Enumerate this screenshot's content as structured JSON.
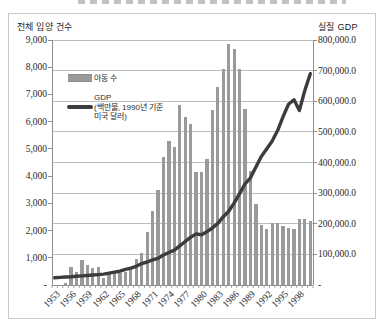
{
  "legend": {
    "bars_label": "아동 수",
    "gdp_line1": "GDP",
    "gdp_line2": "(백만불, 1990년 기준",
    "gdp_line3": "미국 달러)"
  },
  "chart_data": {
    "type": "combo-bar-line",
    "x": [
      1953,
      1954,
      1955,
      1956,
      1957,
      1958,
      1959,
      1960,
      1961,
      1962,
      1963,
      1964,
      1965,
      1966,
      1967,
      1968,
      1969,
      1970,
      1971,
      1972,
      1973,
      1974,
      1975,
      1976,
      1977,
      1978,
      1979,
      1980,
      1981,
      1982,
      1983,
      1984,
      1985,
      1986,
      1987,
      1988,
      1989,
      1990,
      1991,
      1992,
      1993,
      1994,
      1995,
      1996,
      1997,
      1998,
      1999,
      2000
    ],
    "x_tick_labels": [
      "1953",
      "1956",
      "1959",
      "1962",
      "1965",
      "1968",
      "1971",
      "1974",
      "1977",
      "1980",
      "1983",
      "1986",
      "1989",
      "1992",
      "1995",
      "1998"
    ],
    "x_tick_step": 3,
    "series": [
      {
        "name": "아동 수",
        "type": "bar",
        "axis": "left",
        "color": "#9a9a9a",
        "values": [
          4,
          8,
          59,
          671,
          486,
          930,
          741,
          638,
          660,
          254,
          442,
          462,
          451,
          494,
          626,
          949,
          1190,
          1932,
          2725,
          3490,
          4688,
          5302,
          5077,
          6597,
          6159,
          5917,
          4148,
          4144,
          4628,
          6434,
          7263,
          7924,
          8837,
          8680,
          7947,
          6463,
          4191,
          2962,
          2197,
          2045,
          2290,
          2262,
          2180,
          2080,
          2057,
          2443,
          2409,
          2360
        ]
      },
      {
        "name": "GDP (백만불, 1990년 기준 미국 달러)",
        "type": "line",
        "axis": "right",
        "color": "#3c3c3c",
        "values": [
          23600,
          24900,
          26200,
          26800,
          28300,
          29800,
          31000,
          32500,
          34000,
          35500,
          39000,
          42000,
          45000,
          51000,
          55000,
          61000,
          70000,
          75000,
          82000,
          87000,
          98000,
          106000,
          114000,
          128000,
          142000,
          156000,
          167000,
          164000,
          174000,
          186000,
          201000,
          223000,
          241000,
          268000,
          298000,
          330000,
          350000,
          385000,
          420000,
          445000,
          470000,
          505000,
          550000,
          590000,
          605000,
          570000,
          635000,
          690000
        ]
      }
    ],
    "left_axis": {
      "title": "전체 입양 건수",
      "min": 0,
      "max": 9000,
      "step": 1000,
      "tick_labels": [
        "9,000",
        "8,000",
        "7,000",
        "6,000",
        "5,000",
        "4,000",
        "3,000",
        "2,000",
        "1,000",
        "-"
      ]
    },
    "right_axis": {
      "title": "실질 GDP",
      "min": 0,
      "max": 800000,
      "step": 100000,
      "tick_labels": [
        "800,000.0",
        "700,000.0",
        "600,000.0",
        "500,000.0",
        "400,000.0",
        "300,000.0",
        "200,000.0",
        "100,000.0",
        "-"
      ]
    },
    "grid": "horizontal",
    "legend_position": "upper-left-inside"
  }
}
